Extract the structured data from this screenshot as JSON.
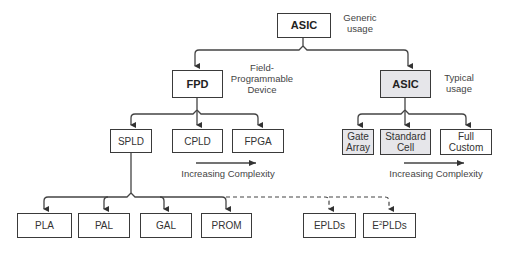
{
  "diagram": {
    "root": {
      "label": "ASIC",
      "note_line1": "Generic",
      "note_line2": "usage"
    },
    "fpd": {
      "label": "FPD",
      "note_line1": "Field-",
      "note_line2": "Programmable",
      "note_line3": "Device"
    },
    "asic_typical": {
      "label": "ASIC",
      "note_line1": "Typical",
      "note_line2": "usage"
    },
    "fpd_children": [
      {
        "label": "SPLD"
      },
      {
        "label": "CPLD"
      },
      {
        "label": "FPGA"
      }
    ],
    "asic_children": [
      {
        "line1": "Gate",
        "line2": "Array"
      },
      {
        "line1": "Standard",
        "line2": "Cell"
      },
      {
        "line1": "Full",
        "line2": "Custom"
      }
    ],
    "spld_children": [
      {
        "label": "PLA"
      },
      {
        "label": "PAL"
      },
      {
        "label": "GAL"
      },
      {
        "label": "PROM"
      }
    ],
    "dashed_children": [
      {
        "label": "EPLDs"
      },
      {
        "prefix": "E",
        "sup": "2",
        "suffix": "PLDs"
      }
    ],
    "complexity_left": "Increasing Complexity",
    "complexity_right": "Increasing Complexity"
  }
}
